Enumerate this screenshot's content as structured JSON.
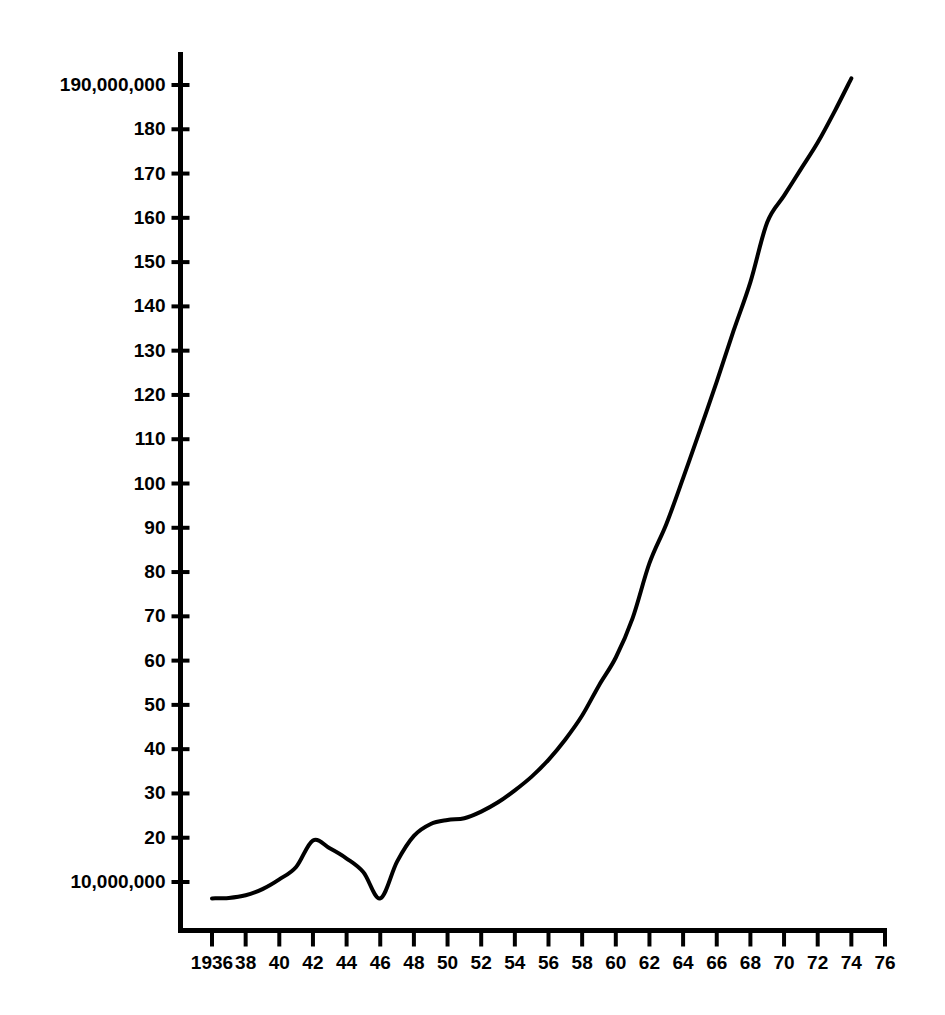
{
  "chart_data": {
    "type": "line",
    "title": "",
    "subtitle": "",
    "xlabel": "",
    "ylabel": "",
    "grid": false,
    "legend": null,
    "background_color": "#ffffff",
    "line_color": "#000000",
    "axis_color": "#000000",
    "line_width_px": 4,
    "xlim": [
      1936,
      1976
    ],
    "ylim": [
      5000000,
      195000000
    ],
    "x_tick_values": [
      1936,
      1938,
      1940,
      1942,
      1944,
      1946,
      1948,
      1950,
      1952,
      1954,
      1956,
      1958,
      1960,
      1962,
      1964,
      1966,
      1968,
      1970,
      1972,
      1974,
      1976
    ],
    "x_tick_labels": [
      "1936",
      "38",
      "40",
      "42",
      "44",
      "46",
      "48",
      "50",
      "52",
      "54",
      "56",
      "58",
      "60",
      "62",
      "64",
      "66",
      "68",
      "70",
      "72",
      "74",
      "76"
    ],
    "y_tick_values": [
      10000000,
      20000000,
      30000000,
      40000000,
      50000000,
      60000000,
      70000000,
      80000000,
      90000000,
      100000000,
      110000000,
      120000000,
      130000000,
      140000000,
      150000000,
      160000000,
      170000000,
      180000000,
      190000000
    ],
    "y_tick_labels": [
      "10,000,000",
      "20",
      "30",
      "40",
      "50",
      "60",
      "70",
      "80",
      "90",
      "100",
      "110",
      "120",
      "130",
      "140",
      "150",
      "160",
      "170",
      "180",
      "190,000,000"
    ],
    "x": [
      1936,
      1937,
      1938,
      1939,
      1940,
      1941,
      1942,
      1943,
      1944,
      1945,
      1946,
      1947,
      1948,
      1949,
      1950,
      1951,
      1952,
      1953,
      1954,
      1955,
      1956,
      1957,
      1958,
      1959,
      1960,
      1961,
      1962,
      1963,
      1964,
      1965,
      1966,
      1967,
      1968,
      1969,
      1970,
      1971,
      1972,
      1973,
      1974
    ],
    "values": [
      6300000,
      6400000,
      7000000,
      8400000,
      10600000,
      13400000,
      19400000,
      17600000,
      15300000,
      12200000,
      6300000,
      14600000,
      20400000,
      23100000,
      24000000,
      24400000,
      25900000,
      28000000,
      30700000,
      33800000,
      37600000,
      42200000,
      47600000,
      54400000,
      60700000,
      69600000,
      82000000,
      90800000,
      101200000,
      112000000,
      123000000,
      134500000,
      145500000,
      159000000,
      165000000,
      171000000,
      177000000,
      184000000,
      191500000
    ],
    "series_name": "value",
    "annotations": []
  },
  "meta": {
    "figure_width": 945,
    "figure_height": 1015
  }
}
